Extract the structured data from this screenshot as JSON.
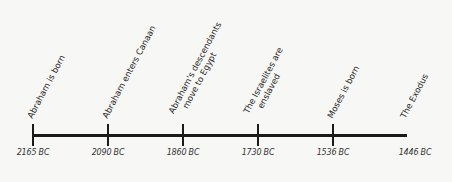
{
  "timeline": {
    "events": [
      {
        "date": "2165 BC",
        "label": [
          "Abraham is born"
        ],
        "x": 33
      },
      {
        "date": "2090 BC",
        "label": [
          "Abraham enters Canaan"
        ],
        "x": 108
      },
      {
        "date": "1860 BC",
        "label": [
          "Abraham's descendants",
          "move to Egypt"
        ],
        "x": 183
      },
      {
        "date": "1730 BC",
        "label": [
          "The Israelites are",
          "enslaved"
        ],
        "x": 258
      },
      {
        "date": "1536 BC",
        "label": [
          "Moses is born"
        ],
        "x": 333
      },
      {
        "date": "1446 BC",
        "label": [
          "The Exodus"
        ],
        "x": 407
      }
    ]
  }
}
